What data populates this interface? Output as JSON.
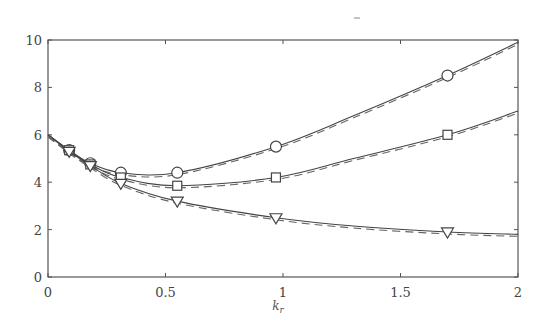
{
  "chart_data": {
    "type": "line",
    "title": "",
    "xlabel": "k_r",
    "xlabel_main": "k",
    "xlabel_sub": "r",
    "ylabel": "",
    "xlim": [
      0,
      2
    ],
    "ylim": [
      0,
      10
    ],
    "xticks": [
      0,
      0.5,
      1,
      1.5,
      2
    ],
    "xtick_labels": [
      "0",
      "0.5",
      "1",
      "1.5",
      "2"
    ],
    "yticks": [
      0,
      2,
      4,
      6,
      8,
      10
    ],
    "ytick_labels": [
      "0",
      "2",
      "4",
      "6",
      "8",
      "10"
    ],
    "grid": false,
    "legend": null,
    "marker_x": [
      0.09,
      0.18,
      0.31,
      0.55,
      0.97,
      1.7
    ],
    "series": [
      {
        "name": "circle",
        "marker": "circle",
        "line_style": "solid+dashed",
        "x": [
          0.0,
          0.09,
          0.18,
          0.31,
          0.55,
          0.97,
          1.3,
          1.7,
          2.0
        ],
        "values": [
          6.0,
          5.35,
          4.8,
          4.4,
          4.4,
          5.5,
          6.8,
          8.5,
          9.9
        ]
      },
      {
        "name": "square",
        "marker": "square",
        "line_style": "solid+dashed",
        "x": [
          0.0,
          0.09,
          0.18,
          0.31,
          0.55,
          0.97,
          1.3,
          1.7,
          2.0
        ],
        "values": [
          6.0,
          5.35,
          4.75,
          4.2,
          3.85,
          4.2,
          5.0,
          6.0,
          7.0
        ]
      },
      {
        "name": "triangle",
        "marker": "triangle-down",
        "line_style": "solid+dashed",
        "x": [
          0.0,
          0.09,
          0.18,
          0.31,
          0.55,
          0.97,
          1.3,
          1.7,
          2.0
        ],
        "values": [
          6.0,
          5.3,
          4.7,
          3.95,
          3.2,
          2.5,
          2.15,
          1.9,
          1.8
        ]
      }
    ]
  },
  "colors": {
    "axis": "#555555",
    "line": "#444444",
    "dashed": "#666666",
    "text": "#444444"
  }
}
